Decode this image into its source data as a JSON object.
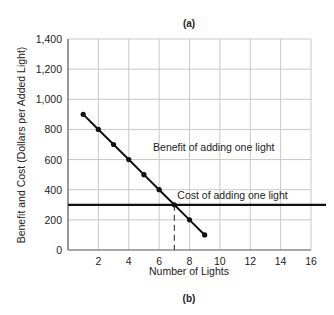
{
  "chart_data": {
    "type": "line",
    "title": "(a)",
    "caption": "(b)",
    "xlabel": "Number of Lights",
    "ylabel": "Benefit and Cost (Dollars per Added Light)",
    "xlim": [
      0,
      16
    ],
    "ylim": [
      0,
      1400
    ],
    "xticks": [
      2,
      4,
      6,
      8,
      10,
      12,
      14,
      16
    ],
    "xtick_labels": [
      "2",
      "4",
      "6",
      "8",
      "10",
      "12",
      "14",
      "16"
    ],
    "yticks": [
      0,
      200,
      400,
      600,
      800,
      1000,
      1200,
      1400
    ],
    "ytick_labels": [
      "0",
      "200",
      "400",
      "600",
      "800",
      "1,000",
      "1,200",
      "1,400"
    ],
    "grid": true,
    "series": [
      {
        "name": "Benefit of adding one light",
        "x": [
          1,
          2,
          3,
          4,
          5,
          6,
          7,
          8,
          9
        ],
        "values": [
          900,
          800,
          700,
          600,
          500,
          400,
          300,
          200,
          100
        ],
        "markers": true
      },
      {
        "name": "Cost of adding one light",
        "x": [
          0,
          17
        ],
        "values": [
          300,
          300
        ],
        "markers": false
      }
    ],
    "annotations": [
      {
        "text": "Benefit of adding one light",
        "x": 5.6,
        "y": 660
      },
      {
        "text": "Cost of adding one light",
        "x": 7.2,
        "y": 340
      },
      {
        "type": "dashed-vline",
        "x": 7,
        "from": 0,
        "to": 300
      }
    ]
  }
}
